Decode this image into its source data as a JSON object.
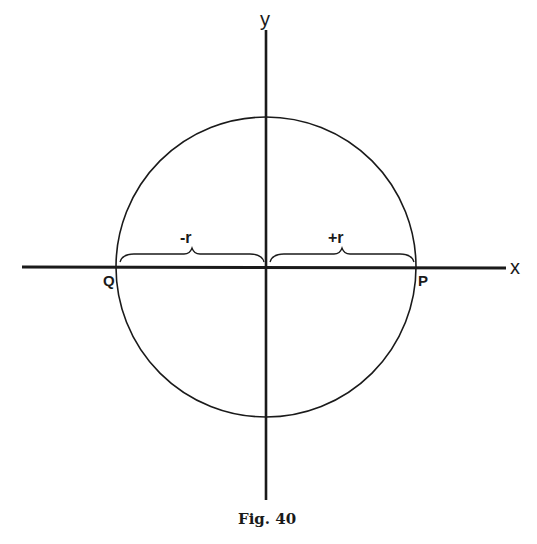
{
  "figure": {
    "caption": "Fig. 40",
    "axes": {
      "x_label": "x",
      "y_label": "y"
    },
    "points": {
      "P": "P",
      "Q": "Q"
    },
    "braces": {
      "negative": "-r",
      "positive": "+r"
    },
    "circle": {
      "center": [
        266,
        267
      ],
      "radius": 150
    },
    "colors": {
      "ink": "#1a1a1a",
      "background": "#ffffff"
    }
  }
}
